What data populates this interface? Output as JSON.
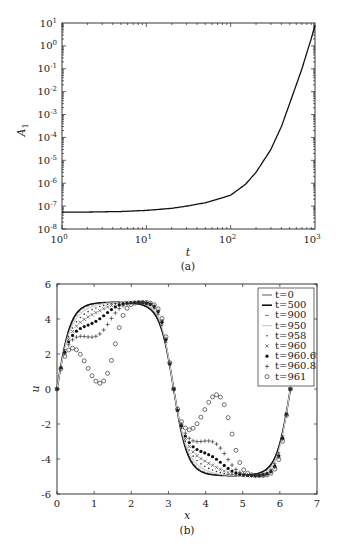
{
  "chart_data": [
    {
      "type": "line",
      "panel": "(a)",
      "title": "",
      "xlabel": "t",
      "ylabel": "A_1",
      "xscale": "log",
      "yscale": "log",
      "xlim": [
        1,
        1000
      ],
      "ylim": [
        1e-08,
        10
      ],
      "xticks": [
        "10^0",
        "10^1",
        "10^2",
        "10^3"
      ],
      "yticks": [
        "10^1",
        "10^0",
        "10^-1",
        "10^-2",
        "10^-3",
        "10^-4",
        "10^-5",
        "10^-6",
        "10^-7",
        "10^-8"
      ],
      "grid": false,
      "series": [
        {
          "name": "A_1",
          "x": [
            1,
            2,
            5,
            10,
            20,
            30,
            50,
            70,
            100,
            150,
            200,
            300,
            400,
            500,
            600,
            700,
            800,
            900,
            1000
          ],
          "y": [
            5.5e-08,
            5.5e-08,
            5.8e-08,
            6.5e-08,
            8e-08,
            1e-07,
            1.4e-07,
            2e-07,
            3e-07,
            9e-07,
            3e-06,
            3e-05,
            0.0003,
            0.003,
            0.02,
            0.1,
            0.5,
            2,
            8
          ]
        }
      ]
    },
    {
      "type": "line",
      "panel": "(b)",
      "title": "",
      "xlabel": "x",
      "ylabel": "u",
      "xlim": [
        0,
        7
      ],
      "ylim": [
        -6,
        6
      ],
      "xticks": [
        0,
        1,
        2,
        3,
        4,
        5,
        6,
        7
      ],
      "yticks": [
        6,
        4,
        2,
        0,
        -2,
        -4,
        -6
      ],
      "grid": false,
      "legend_position": "upper right",
      "legend": [
        "t=0",
        "t=500",
        "t=900",
        "t=950",
        "t=958",
        "t=960",
        "t=960.6",
        "t=960.8",
        "t=961"
      ],
      "series": [
        {
          "name": "t=0",
          "style": "thin solid line",
          "shift": 0.0
        },
        {
          "name": "t=500",
          "style": "thick solid line",
          "shift": 0.0
        },
        {
          "name": "t=900",
          "style": "dash-dot line",
          "shift": 0.15
        },
        {
          "name": "t=950",
          "style": "light gray line",
          "shift": 0.35
        },
        {
          "name": "t=958",
          "style": "small dot markers",
          "shift": 0.55
        },
        {
          "name": "t=960",
          "style": "x markers",
          "shift": 0.75
        },
        {
          "name": "t=960.6",
          "style": "filled star markers",
          "shift": 0.95
        },
        {
          "name": "t=960.8",
          "style": "plus markers",
          "shift": 1.15
        },
        {
          "name": "t=961",
          "style": "open circle markers",
          "shift": 1.5
        }
      ],
      "notes": "u(x) ~ 5-amplitude sine-like wave on [0, 2π]; zeros at 0, ~3.1, ~6.28; max ~4.9 near x≈0.8 and x≈3.9; min ~-4.9 near x≈2.4 and x≈5.2; later times steepen toward shock fronts"
    }
  ],
  "panel_a": {
    "caption": "(a)",
    "xlabel": "t",
    "ylabel": "A",
    "ylabel_sub": "1",
    "xticks": [
      {
        "base": "10",
        "exp": "0"
      },
      {
        "base": "10",
        "exp": "1"
      },
      {
        "base": "10",
        "exp": "2"
      },
      {
        "base": "10",
        "exp": "3"
      }
    ],
    "yticks": [
      {
        "base": "10",
        "exp": "1"
      },
      {
        "base": "10",
        "exp": "0"
      },
      {
        "base": "10",
        "exp": "-1"
      },
      {
        "base": "10",
        "exp": "-2"
      },
      {
        "base": "10",
        "exp": "-3"
      },
      {
        "base": "10",
        "exp": "-4"
      },
      {
        "base": "10",
        "exp": "-5"
      },
      {
        "base": "10",
        "exp": "-6"
      },
      {
        "base": "10",
        "exp": "-7"
      },
      {
        "base": "10",
        "exp": "-8"
      }
    ]
  },
  "panel_b": {
    "caption": "(b)",
    "xlabel": "x",
    "ylabel": "u",
    "xticks": [
      "0",
      "1",
      "2",
      "3",
      "4",
      "5",
      "6",
      "7"
    ],
    "yticks": [
      "6",
      "4",
      "2",
      "0",
      "-2",
      "-4",
      "-6"
    ],
    "legend": [
      {
        "label": "t=0",
        "marker": "thin-line"
      },
      {
        "label": "t=500",
        "marker": "thick-line"
      },
      {
        "label": "t=900",
        "marker": "dash"
      },
      {
        "label": "t=950",
        "marker": "light-line"
      },
      {
        "label": "t=958",
        "marker": "dot"
      },
      {
        "label": "t=960",
        "marker": "x"
      },
      {
        "label": "t=960.6",
        "marker": "star"
      },
      {
        "label": "t=960.8",
        "marker": "plus"
      },
      {
        "label": "t=961",
        "marker": "circle"
      }
    ]
  }
}
